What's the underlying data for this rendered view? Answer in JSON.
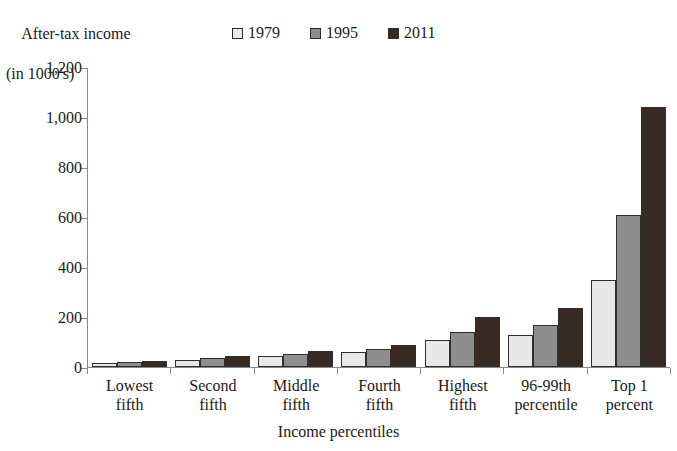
{
  "chart_data": {
    "type": "bar",
    "title": "",
    "ylabel_line1": "After-tax income",
    "ylabel_line2": "(in 1000's)",
    "xlabel": "Income percentiles",
    "categories": [
      "Lowest fifth",
      "Second fifth",
      "Middle fifth",
      "Fourth fifth",
      "Highest fifth",
      "96-99th percentile",
      "Top 1 percent"
    ],
    "category_lines": [
      [
        "Lowest",
        "fifth"
      ],
      [
        "Second",
        "fifth"
      ],
      [
        "Middle",
        "fifth"
      ],
      [
        "Fourth",
        "fifth"
      ],
      [
        "Highest",
        "fifth"
      ],
      [
        "96-99th",
        "percentile"
      ],
      [
        "Top 1",
        "percent"
      ]
    ],
    "series": [
      {
        "name": "1979",
        "color": "#e8e8e8",
        "values": [
          15,
          30,
          45,
          60,
          110,
          130,
          350
        ]
      },
      {
        "name": "1995",
        "color": "#8e8e8e",
        "values": [
          19,
          36,
          54,
          74,
          140,
          170,
          610
        ]
      },
      {
        "name": "2011",
        "color": "#382b24",
        "values": [
          24,
          45,
          65,
          90,
          200,
          235,
          1040
        ]
      }
    ],
    "ylim": [
      0,
      1200
    ],
    "ytick_values": [
      0,
      200,
      400,
      600,
      800,
      1000,
      1200
    ],
    "ytick_labels": [
      "0",
      "200",
      "400",
      "600",
      "800",
      "1,000",
      "1,200"
    ],
    "grid": false,
    "legend_position": "top-center",
    "axis_color": "#8a8a8a",
    "bar_outline_color": "#2e2e2e"
  }
}
